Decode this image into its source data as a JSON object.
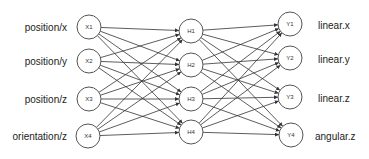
{
  "diagram": {
    "type": "neural-network",
    "input_layer": {
      "nodes": [
        {
          "id": "X1",
          "label": "X1",
          "io_label": "position/x",
          "cx": 89,
          "cy": 27
        },
        {
          "id": "X2",
          "label": "X2",
          "io_label": "position/y",
          "cx": 89,
          "cy": 61
        },
        {
          "id": "X3",
          "label": "X3",
          "io_label": "position/z",
          "cx": 89,
          "cy": 99
        },
        {
          "id": "X4",
          "label": "X4",
          "io_label": "orientation/z",
          "cx": 88,
          "cy": 136
        }
      ]
    },
    "hidden_layer": {
      "nodes": [
        {
          "id": "H1",
          "label": "H1",
          "cx": 191,
          "cy": 31
        },
        {
          "id": "H2",
          "label": "H2",
          "cx": 191,
          "cy": 65
        },
        {
          "id": "H3",
          "label": "H3",
          "cx": 191,
          "cy": 99
        },
        {
          "id": "H4",
          "label": "H4",
          "cx": 191,
          "cy": 132
        }
      ]
    },
    "output_layer": {
      "nodes": [
        {
          "id": "Y1",
          "label": "Y1",
          "io_label": "linear.x",
          "cx": 290,
          "cy": 24
        },
        {
          "id": "Y2",
          "label": "Y2",
          "io_label": "linear.y",
          "cx": 290,
          "cy": 58
        },
        {
          "id": "Y3",
          "label": "Y3",
          "io_label": "linear.z",
          "cx": 290,
          "cy": 97
        },
        {
          "id": "Y4",
          "label": "Y4",
          "io_label": "angular.z",
          "cx": 291,
          "cy": 135
        }
      ]
    },
    "node_radius": 12,
    "connections": "fully-connected",
    "edge_color": "#333333",
    "node_stroke_color": "#555555"
  }
}
